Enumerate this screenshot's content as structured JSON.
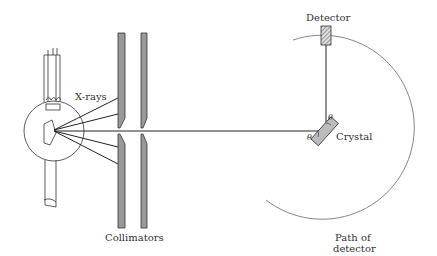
{
  "labels": {
    "xrays": "X-rays",
    "collimators": "Collimators",
    "detector": "Detector",
    "crystal": "Crystal",
    "path_line1": "Path of",
    "path_line2": "detector",
    "theta_in": "θ",
    "theta_out": "θ"
  },
  "colors": {
    "line": "#333333",
    "fill": "#bbbbbb",
    "circle": "#777777"
  }
}
